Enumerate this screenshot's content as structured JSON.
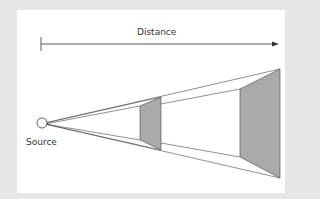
{
  "diagram": {
    "labels": {
      "distance": "Distance",
      "source": "Source"
    },
    "colors": {
      "background": "#e6e6e6",
      "panel": "#ffffff",
      "line": "#333333",
      "shade": "#aaaaaa"
    },
    "elements": [
      {
        "id": "distance-arrow",
        "type": "arrow",
        "label": "Distance"
      },
      {
        "id": "source",
        "type": "point-source",
        "label": "Source"
      },
      {
        "id": "near-surface",
        "type": "shaded-quad"
      },
      {
        "id": "far-surface",
        "type": "shaded-quad"
      }
    ]
  }
}
